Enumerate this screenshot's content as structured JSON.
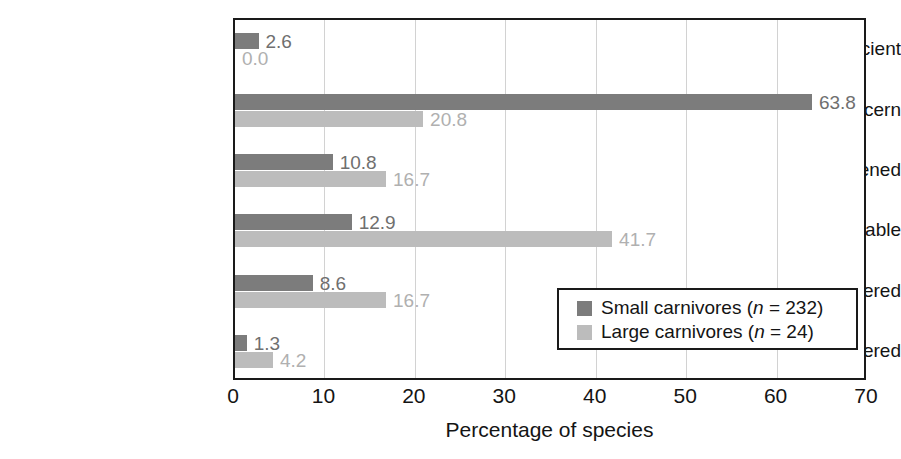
{
  "chart_data": {
    "type": "bar",
    "orientation": "horizontal",
    "title": "",
    "xlabel": "Percentage of species",
    "ylabel": "",
    "xlim": [
      0,
      70
    ],
    "xticks": [
      0,
      10,
      20,
      30,
      40,
      50,
      60,
      70
    ],
    "grid": true,
    "legend_position": "bottom-right-inside",
    "categories": [
      "Data Deficient",
      "Least Concern",
      "Near Threatened",
      "Vulnerable",
      "Endangered",
      "Critically Endangered"
    ],
    "series": [
      {
        "name": "Small carnivores (n = 232)",
        "short_name": "Small carnivores",
        "n": 232,
        "color": "#7c7c7c",
        "values": [
          2.6,
          63.8,
          10.8,
          12.9,
          8.6,
          1.3
        ],
        "labels": [
          "2.6",
          "63.8",
          "10.8",
          "12.9",
          "8.6",
          "1.3"
        ]
      },
      {
        "name": "Large carnivores (n = 24)",
        "short_name": "Large carnivores",
        "n": 24,
        "color": "#bcbcbc",
        "values": [
          0.0,
          20.8,
          16.7,
          41.7,
          16.7,
          4.2
        ],
        "labels": [
          "0.0",
          "20.8",
          "16.7",
          "41.7",
          "16.7",
          "4.2"
        ]
      }
    ]
  },
  "axis": {
    "tick_labels": [
      "0",
      "10",
      "20",
      "30",
      "40",
      "50",
      "60",
      "70"
    ],
    "x_title": "Percentage of species"
  },
  "legend": {
    "entries": [
      {
        "label_prefix": "Small carnivores (",
        "n_symbol": "n",
        "label_suffix": " = 232)"
      },
      {
        "label_prefix": "Large carnivores (",
        "n_symbol": "n",
        "label_suffix": " = 24)"
      }
    ]
  },
  "colors": {
    "small_carnivores": "#7c7c7c",
    "large_carnivores": "#bcbcbc",
    "axis": "#1a1a1a",
    "gridline": "#d2d2d2",
    "text": "#141414"
  }
}
